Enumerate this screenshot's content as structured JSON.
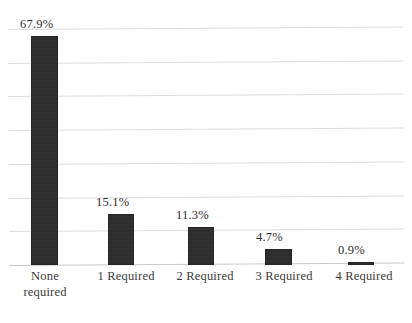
{
  "chart_data": {
    "type": "bar",
    "title": "",
    "subtitle": "",
    "xlabel": "",
    "ylabel": "",
    "categories": [
      "None\nrequired",
      "1 Required",
      "2 Required",
      "3 Required",
      "4 Required"
    ],
    "values": [
      67.9,
      15.1,
      11.3,
      4.7,
      0.9
    ],
    "value_labels": [
      "67.9%",
      "15.1%",
      "11.3%",
      "4.7%",
      "0.9%"
    ],
    "ylim": [
      0,
      70
    ],
    "y_gridline_values": [
      0,
      10,
      20,
      30,
      40,
      50,
      60,
      70
    ],
    "grid": true,
    "y_tick_labels_shown": false,
    "legend": null,
    "legend_position": "none",
    "bar_color": "#2b2b2b",
    "gridline_color": "#dcdcdc",
    "background_color": "#ffffff"
  }
}
